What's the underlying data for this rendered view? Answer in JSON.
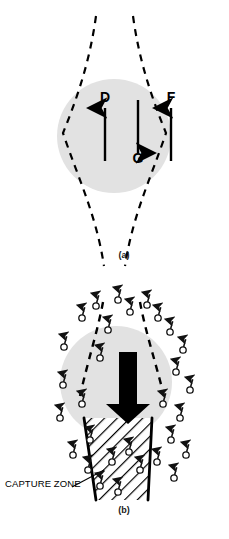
{
  "figure": {
    "background_color": "#ffffff",
    "width": 229,
    "height": 539
  },
  "colors": {
    "drop_fill": "#e2e2e2",
    "stroke": "#000000",
    "text": "#000000",
    "label_text": "#1a1a1a",
    "particle_outline": "#111111"
  },
  "panels": [
    {
      "id": "a",
      "label": "(a)",
      "label_x": 114,
      "label_y": 256,
      "drop": {
        "cx": 114,
        "cy": 136,
        "r": 57,
        "fill": "#e2e2e2"
      },
      "streamlines": {
        "style": "dashed",
        "dash": "7 6",
        "width": 2.2,
        "paths": [
          "M 96 16 C 90 60, 78 96, 63 133 C 78 178, 96 214, 104 266",
          "M 133 16 C 139 60, 151 96, 166 133 C 151 178, 133 214, 125 266"
        ]
      },
      "force_arrows": [
        {
          "name": "drag",
          "label": "D",
          "direction": "up",
          "label_x": 105,
          "label_y": 97,
          "x": 105,
          "y_tail": 161,
          "y_head": 105
        },
        {
          "name": "gravity",
          "label": "G",
          "direction": "down",
          "label_x": 138,
          "label_y": 175,
          "x": 138,
          "y_tail": 100,
          "y_head": 157
        },
        {
          "name": "field",
          "label": "F",
          "direction": "up",
          "label_x": 171,
          "label_y": 97,
          "x": 171,
          "y_tail": 161,
          "y_head": 105
        }
      ]
    },
    {
      "id": "b",
      "label": "(b)",
      "label_x": 114,
      "label_y": 511,
      "drop": {
        "cx": 116,
        "cy": 382,
        "r": 56,
        "fill": "#e2e2e2"
      },
      "fall_arrow": {
        "name": "fall-direction-arrow",
        "direction": "down",
        "x": 128,
        "y_top": 352,
        "y_bottom": 418,
        "shaft_width": 18,
        "head_width": 40,
        "head_height": 24
      },
      "streamlines": {
        "style": "dashed",
        "dash": "7 6",
        "width": 2.4,
        "paths": [
          "M 103 302 C 98 330, 88 360, 78 394",
          "M 140 302 C 145 330, 155 360, 166 394"
        ]
      },
      "capture_zone": {
        "label": "CAPTURE ZONE",
        "label_x": 5,
        "label_y": 484,
        "leader_line": {
          "x1": 72,
          "y1": 487,
          "x2": 102,
          "y2": 470
        },
        "hatch_angle_deg": 45,
        "hatch_spacing": 9,
        "outline_width": 2.6,
        "shape": "M 84 418 L 152 418 L 148 500 L 96 500 Z"
      },
      "particles": {
        "glyph": "circle-with-arrow-tail",
        "circle_radius": 3.2,
        "tail_length": 8,
        "tail_angle_deg": 20,
        "count": 30,
        "positions": [
          [
            64,
            347
          ],
          [
            82,
            318
          ],
          [
            96,
            306
          ],
          [
            108,
            330
          ],
          [
            100,
            358
          ],
          [
            63,
            385
          ],
          [
            60,
            418
          ],
          [
            82,
            404
          ],
          [
            90,
            440
          ],
          [
            73,
            455
          ],
          [
            118,
            300
          ],
          [
            130,
            312
          ],
          [
            147,
            305
          ],
          [
            158,
            318
          ],
          [
            170,
            332
          ],
          [
            183,
            350
          ],
          [
            176,
            372
          ],
          [
            190,
            390
          ],
          [
            163,
            404
          ],
          [
            180,
            418
          ],
          [
            171,
            440
          ],
          [
            186,
            455
          ],
          [
            157,
            462
          ],
          [
            174,
            478
          ],
          [
            88,
            470
          ],
          [
            100,
            486
          ],
          [
            118,
            492
          ],
          [
            140,
            470
          ],
          [
            129,
            452
          ],
          [
            112,
            462
          ]
        ]
      }
    }
  ]
}
